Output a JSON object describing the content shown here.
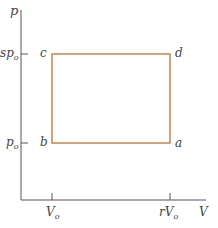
{
  "diagram": {
    "type": "pV-diagram",
    "axes": {
      "y_label": "p",
      "x_label": "V",
      "y_ticks": [
        {
          "label_main": "sp",
          "label_sub": "o"
        },
        {
          "label_main": "p",
          "label_sub": "o"
        }
      ],
      "x_ticks": [
        {
          "label_main": "V",
          "label_sub": "o"
        },
        {
          "label_main": "rV",
          "label_sub": "o"
        }
      ]
    },
    "cycle": {
      "shape": "rectangle",
      "color": "#c8834a",
      "corners": {
        "a": "a",
        "b": "b",
        "c": "c",
        "d": "d"
      }
    }
  }
}
